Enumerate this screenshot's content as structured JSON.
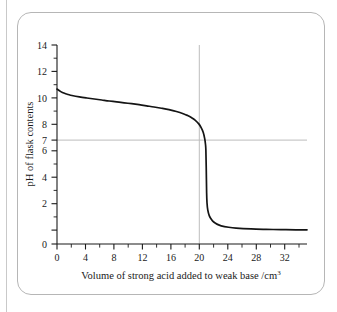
{
  "figure": {
    "frame_border_color": "#b6b6b6",
    "background_color": "#ffffff"
  },
  "chart_data": {
    "type": "line",
    "title": "",
    "xlabel": "Volume of strong acid added to weak base /cm",
    "xlabel_superscript": "3",
    "ylabel": "pH of flask contents",
    "xlim": [
      0,
      33.5
    ],
    "ylim": [
      0,
      14
    ],
    "grid": true,
    "legend": "none",
    "axis_color": "#1a1a1a",
    "curve_color": "#141414",
    "gridline_color": "#bdbdbd",
    "xticks": [
      0,
      4,
      8,
      12,
      16,
      20,
      24,
      28,
      32
    ],
    "xtick_labels": [
      "0",
      "4",
      "8",
      "12",
      "16",
      "20",
      "24",
      "28",
      "32"
    ],
    "xminor_step": 2,
    "yticks": [
      0,
      2,
      4,
      6,
      7,
      8,
      10,
      12,
      14
    ],
    "ytick_labels": [
      "0",
      "2",
      "4",
      "6",
      "7",
      "8",
      "10",
      "12",
      "14"
    ],
    "gridlines": [
      {
        "orientation": "horizontal",
        "value": 7,
        "label": "pH 7 neutral line"
      },
      {
        "orientation": "vertical",
        "value": 20,
        "label": "equivalence point volume"
      }
    ],
    "annotations": [
      {
        "name": "equivalence-point",
        "x": 20,
        "y": 7,
        "text": ""
      }
    ],
    "series": [
      {
        "name": "Titration curve: strong acid into weak base",
        "x": [
          0,
          0.5,
          1,
          1.5,
          2,
          3,
          4,
          5,
          6,
          7,
          8,
          9,
          10,
          11,
          12,
          13,
          14,
          15,
          16,
          17,
          17.5,
          18,
          18.5,
          19,
          19.3,
          19.6,
          19.8,
          19.9,
          19.95,
          20,
          20.05,
          20.1,
          20.2,
          20.4,
          20.7,
          21,
          21.5,
          22,
          23,
          24,
          26,
          28,
          30,
          32,
          33.5
        ],
        "y": [
          10.9,
          10.72,
          10.6,
          10.52,
          10.45,
          10.35,
          10.27,
          10.2,
          10.13,
          10.06,
          10.0,
          9.93,
          9.87,
          9.8,
          9.72,
          9.64,
          9.55,
          9.45,
          9.32,
          9.15,
          9.04,
          8.9,
          8.72,
          8.45,
          8.2,
          7.85,
          7.4,
          7.0,
          6.6,
          5.3,
          3.6,
          2.9,
          2.4,
          2.0,
          1.72,
          1.55,
          1.38,
          1.28,
          1.18,
          1.12,
          1.06,
          1.03,
          1.01,
          1.0,
          1.0
        ]
      }
    ]
  }
}
